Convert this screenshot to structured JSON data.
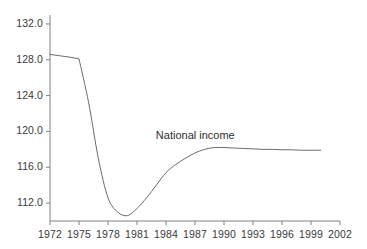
{
  "chart_data": {
    "type": "line",
    "title": "",
    "xlabel": "",
    "ylabel": "",
    "xlim": [
      1972,
      2002
    ],
    "ylim": [
      110.0,
      133.0
    ],
    "grid": false,
    "legend_position": "inline-annotation",
    "annotations": [
      {
        "text": "National income",
        "x": 1987.5,
        "y": 119.4
      }
    ],
    "xticks": [
      1972,
      1975,
      1978,
      1981,
      1984,
      1987,
      1990,
      1993,
      1996,
      1999,
      2002
    ],
    "xtick_labels": [
      "1972",
      "1975",
      "1978",
      "1981",
      "1984",
      "1987",
      "1990",
      "1993",
      "1996",
      "1999",
      "2002"
    ],
    "yticks": [
      112.0,
      116.0,
      120.0,
      124.0,
      128.0,
      132.0
    ],
    "ytick_labels": [
      "112.0",
      "116.0",
      "120.0",
      "124.0",
      "128.0",
      "132.0"
    ],
    "series": [
      {
        "name": "National income",
        "color": "#6b6b6b",
        "x": [
          1972,
          1973,
          1974,
          1975,
          1976,
          1977,
          1978,
          1979,
          1980,
          1981,
          1982,
          1983,
          1984,
          1985,
          1986,
          1987,
          1988,
          1989,
          1990,
          1991,
          1992,
          1993,
          1994,
          1995,
          1996,
          1997,
          1998,
          1999,
          2000
        ],
        "values": [
          128.6,
          128.45,
          128.3,
          128.1,
          123.2,
          117.0,
          112.6,
          111.0,
          110.6,
          111.4,
          112.6,
          114.0,
          115.4,
          116.3,
          117.0,
          117.6,
          118.0,
          118.2,
          118.2,
          118.15,
          118.1,
          118.05,
          118.0,
          118.0,
          117.95,
          117.95,
          117.9,
          117.9,
          117.9
        ]
      }
    ]
  },
  "axes": {
    "axis_color": "#808080",
    "tick_color": "#808080",
    "text_color": "#3a3a3a"
  }
}
